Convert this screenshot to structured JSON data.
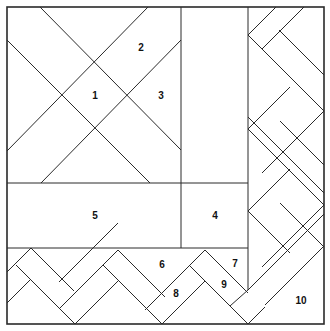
{
  "diagram": {
    "type": "quilt-block-pattern",
    "line_color": "#2a2a2a",
    "background": "#ffffff",
    "pieces": [
      {
        "id": "1",
        "label": "1",
        "x": 95,
        "y": 96
      },
      {
        "id": "2",
        "label": "2",
        "x": 141,
        "y": 48
      },
      {
        "id": "3",
        "label": "3",
        "x": 161,
        "y": 96
      },
      {
        "id": "4",
        "label": "4",
        "x": 215,
        "y": 216
      },
      {
        "id": "5",
        "label": "5",
        "x": 95,
        "y": 216
      },
      {
        "id": "6",
        "label": "6",
        "x": 162,
        "y": 265
      },
      {
        "id": "7",
        "label": "7",
        "x": 235,
        "y": 264
      },
      {
        "id": "8",
        "label": "8",
        "x": 176,
        "y": 294
      },
      {
        "id": "9",
        "label": "9",
        "x": 224,
        "y": 285
      },
      {
        "id": "10",
        "label": "10",
        "x": 301,
        "y": 301
      }
    ]
  }
}
